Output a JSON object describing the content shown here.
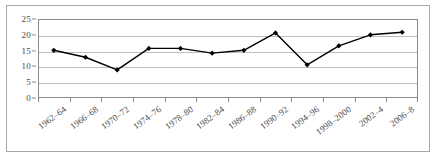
{
  "chart_data": {
    "type": "line",
    "title": "",
    "subtitle": "",
    "xlabel": "",
    "ylabel": "",
    "categories": [
      "1962–64",
      "1966–68",
      "1970–72",
      "1974–76",
      "1978–80",
      "1982–84",
      "1986–88",
      "1990–92",
      "1994–96",
      "1998–2000",
      "2002–4",
      "2006–8"
    ],
    "values": [
      15.1,
      12.9,
      8.9,
      15.7,
      15.7,
      14.2,
      15.1,
      20.6,
      10.5,
      16.5,
      20.0,
      20.8
    ],
    "series": [
      {
        "name": "",
        "values": [
          15.1,
          12.9,
          8.9,
          15.7,
          15.7,
          14.2,
          15.1,
          20.6,
          10.5,
          16.5,
          20.0,
          20.8
        ]
      }
    ],
    "ylim": [
      0,
      25
    ],
    "yticks": [
      0,
      5,
      10,
      15,
      20,
      25
    ],
    "ytick_labels": [
      "0",
      "5",
      "10",
      "15",
      "20",
      "25"
    ],
    "grid": true,
    "grid_axis": "y",
    "legend": false,
    "legend_position": "none",
    "marker": "diamond",
    "marker_color": "#000000",
    "line_color": "#000000",
    "line_width": 1.4,
    "background_color": "#ffffff",
    "grid_color": "#bdbdbd",
    "axis_color": "#8a8a8a",
    "tick_label_color": "#4a4a4a",
    "xtick_label_rotation": -37
  }
}
